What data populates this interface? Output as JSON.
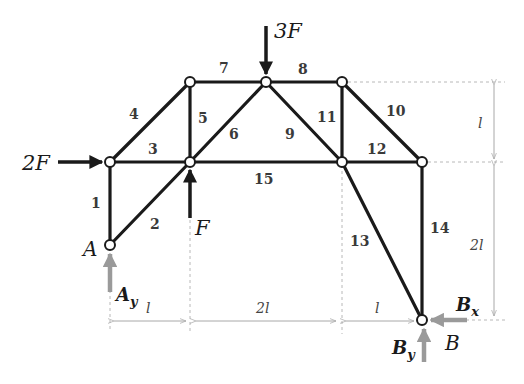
{
  "diagram": {
    "members": [
      {
        "id": "1",
        "label": "1"
      },
      {
        "id": "2",
        "label": "2"
      },
      {
        "id": "3",
        "label": "3"
      },
      {
        "id": "4",
        "label": "4"
      },
      {
        "id": "5",
        "label": "5"
      },
      {
        "id": "6",
        "label": "6"
      },
      {
        "id": "7",
        "label": "7"
      },
      {
        "id": "8",
        "label": "8"
      },
      {
        "id": "9",
        "label": "9"
      },
      {
        "id": "10",
        "label": "10"
      },
      {
        "id": "11",
        "label": "11"
      },
      {
        "id": "12",
        "label": "12"
      },
      {
        "id": "13",
        "label": "13"
      },
      {
        "id": "14",
        "label": "14"
      },
      {
        "id": "15",
        "label": "15"
      }
    ],
    "loads": {
      "horizontal": "2F",
      "top": "3F",
      "bottom": "F"
    },
    "supports": {
      "left": "A",
      "right": "B"
    },
    "reactions": {
      "ay_main": "A",
      "ay_sub": "y",
      "by_main": "B",
      "by_sub": "y",
      "bx_main": "B",
      "bx_sub": "x"
    },
    "dimensions": {
      "horizontal": [
        "l",
        "2l",
        "l"
      ],
      "vertical": [
        "l",
        "2l"
      ]
    },
    "colors": {
      "member": "#1a1a1a",
      "reaction": "#9a9a9a",
      "dimension": "#a8a8a8"
    }
  }
}
